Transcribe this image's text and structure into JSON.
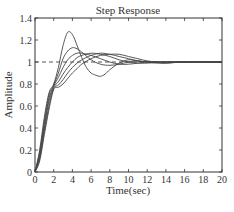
{
  "chart_data": {
    "type": "line",
    "title": "Step Response",
    "xlabel": "Time(sec)",
    "ylabel": "Amplitude",
    "xlim": [
      0,
      20
    ],
    "ylim": [
      0,
      1.4
    ],
    "xticks": [
      0,
      2,
      4,
      6,
      8,
      10,
      12,
      14,
      16,
      18,
      20
    ],
    "yticks": [
      0,
      0.2,
      0.4,
      0.6,
      0.8,
      1,
      1.2,
      1.4
    ],
    "ytick_labels": [
      "0",
      "0.2",
      "0.4",
      "0.6",
      "0.8",
      "1",
      "1.2",
      "1.4"
    ],
    "grid": false,
    "legend": null,
    "reference_line": {
      "y": 1,
      "style": "dashed",
      "x_range": [
        0,
        20
      ]
    },
    "series": [
      {
        "name": "response-1",
        "x": [
          0,
          0.5,
          1,
          1.5,
          2,
          2.5,
          3,
          3.5,
          4,
          4.5,
          5,
          5.5,
          6,
          6.5,
          7,
          7.5,
          8,
          9,
          10,
          11,
          12,
          14,
          16,
          20
        ],
        "values": [
          0,
          0.2,
          0.5,
          0.72,
          0.8,
          0.95,
          1.15,
          1.27,
          1.25,
          1.15,
          1.04,
          0.95,
          0.9,
          0.88,
          0.87,
          0.89,
          0.93,
          0.99,
          1.02,
          1.01,
          1.0,
          1.0,
          1.0,
          1.0
        ]
      },
      {
        "name": "response-2",
        "x": [
          0,
          0.5,
          1,
          1.5,
          2,
          2.5,
          3,
          3.5,
          4,
          4.5,
          5,
          6,
          7,
          8,
          9,
          10,
          11,
          12,
          14,
          16,
          20
        ],
        "values": [
          0,
          0.18,
          0.46,
          0.7,
          0.79,
          0.9,
          1.03,
          1.1,
          1.13,
          1.12,
          1.09,
          1.02,
          0.98,
          0.97,
          0.98,
          1.0,
          1.01,
          1.0,
          1.0,
          1.0,
          1.0
        ]
      },
      {
        "name": "response-3",
        "x": [
          0,
          0.5,
          1,
          1.5,
          2,
          2.5,
          3,
          3.5,
          4,
          4.5,
          5,
          6,
          7,
          8,
          9,
          10,
          11,
          12,
          14,
          16,
          20
        ],
        "values": [
          0,
          0.16,
          0.43,
          0.67,
          0.78,
          0.86,
          0.95,
          1.02,
          1.06,
          1.08,
          1.08,
          1.06,
          1.03,
          1.0,
          0.98,
          0.98,
          0.99,
          1.0,
          1.0,
          1.0,
          1.0
        ]
      },
      {
        "name": "response-4",
        "x": [
          0,
          0.5,
          1,
          1.5,
          2,
          2.5,
          3,
          3.5,
          4,
          4.5,
          5,
          6,
          7,
          8,
          9,
          10,
          11,
          12,
          14,
          16,
          20
        ],
        "values": [
          0,
          0.14,
          0.4,
          0.64,
          0.77,
          0.82,
          0.89,
          0.95,
          1.0,
          1.04,
          1.06,
          1.08,
          1.07,
          1.05,
          1.02,
          1.0,
          0.99,
          0.99,
          1.0,
          1.0,
          1.0
        ]
      },
      {
        "name": "response-5",
        "x": [
          0,
          0.5,
          1,
          1.5,
          2,
          2.5,
          3,
          3.5,
          4,
          4.5,
          5,
          6,
          7,
          8,
          9,
          10,
          11,
          12,
          13,
          14,
          16,
          20
        ],
        "values": [
          0,
          0.12,
          0.37,
          0.6,
          0.76,
          0.79,
          0.84,
          0.9,
          0.95,
          0.99,
          1.02,
          1.06,
          1.08,
          1.07,
          1.05,
          1.03,
          1.01,
          1.0,
          0.99,
          0.99,
          1.0,
          1.0
        ]
      },
      {
        "name": "response-6",
        "x": [
          0,
          0.5,
          1,
          1.5,
          2,
          2.5,
          3,
          3.5,
          4,
          4.5,
          5,
          6,
          7,
          8,
          9,
          10,
          11,
          12,
          13,
          14,
          16,
          20
        ],
        "values": [
          0,
          0.1,
          0.34,
          0.57,
          0.75,
          0.77,
          0.8,
          0.85,
          0.9,
          0.94,
          0.98,
          1.03,
          1.06,
          1.07,
          1.07,
          1.05,
          1.03,
          1.01,
          1.0,
          0.99,
          1.0,
          1.0
        ]
      }
    ],
    "colors": {
      "line": "#444444",
      "axes": "#333333",
      "background": "#ffffff"
    }
  }
}
